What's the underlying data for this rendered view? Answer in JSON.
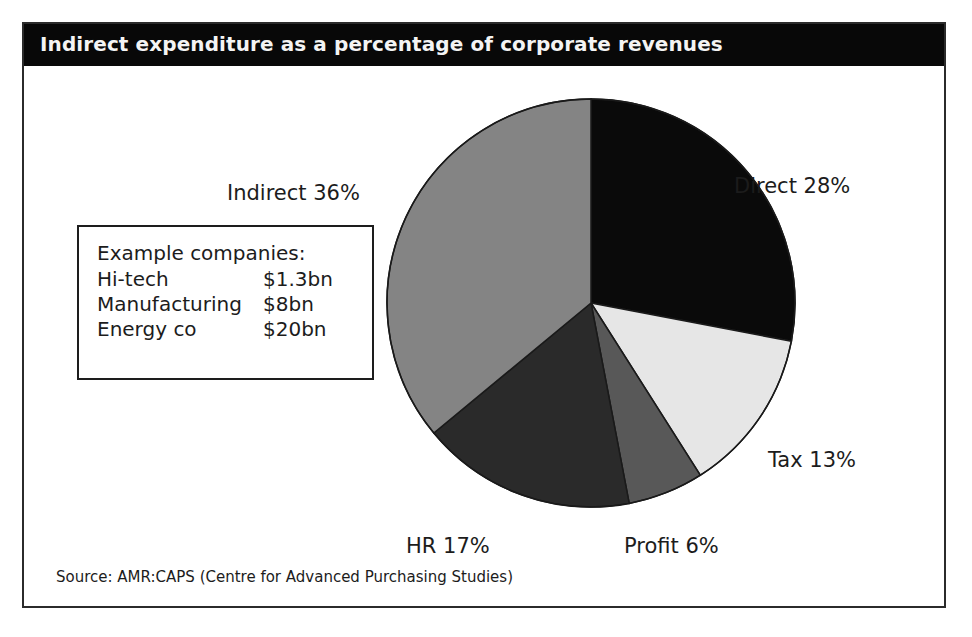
{
  "figure": {
    "title": "Indirect expenditure as a percentage of corporate revenues",
    "source": "Source: AMR:CAPS (Centre for Advanced Purchasing Studies)"
  },
  "example_box": {
    "heading": "Example companies:",
    "rows": [
      {
        "name": "Hi-tech",
        "value": "$1.3bn"
      },
      {
        "name": "Manufacturing",
        "value": "$8bn"
      },
      {
        "name": "Energy co",
        "value": "$20bn"
      }
    ]
  },
  "labels": {
    "indirect": "Indirect 36%",
    "direct": "Direct 28%",
    "tax": "Tax 13%",
    "hr": "HR 17%",
    "profit": "Profit 6%"
  },
  "colors": {
    "direct": "#0a0a0a",
    "tax": "#e6e6e6",
    "profit": "#585858",
    "hr": "#2a2a2a",
    "indirect": "#848484",
    "frame": "#2b2b2b",
    "banner": "#080808",
    "banner_text": "#f4f4f4"
  },
  "chart_data": {
    "type": "pie",
    "title": "Indirect expenditure as a percentage of corporate revenues",
    "xlabel": "",
    "ylabel": "",
    "units": "percent of corporate revenues",
    "start_angle_deg": 0,
    "direction": "clockwise",
    "legend": "none (direct slice labels)",
    "labels": [
      "Direct",
      "Tax",
      "Profit",
      "HR",
      "Indirect"
    ],
    "values": [
      28,
      13,
      6,
      17,
      36
    ],
    "total": 100,
    "slices": [
      {
        "label": "Direct",
        "value": 28,
        "display": "Direct 28%",
        "color": "#0a0a0a"
      },
      {
        "label": "Tax",
        "value": 13,
        "display": "Tax 13%",
        "color": "#e6e6e6"
      },
      {
        "label": "Profit",
        "value": 6,
        "display": "Profit 6%",
        "color": "#585858"
      },
      {
        "label": "HR",
        "value": 17,
        "display": "HR 17%",
        "color": "#2a2a2a"
      },
      {
        "label": "Indirect",
        "value": 36,
        "display": "Indirect 36%",
        "color": "#848484"
      }
    ],
    "annotations": [
      "Example companies: Hi-tech $1.3bn",
      "Example companies: Manufacturing $8bn",
      "Example companies: Energy co $20bn"
    ],
    "source": "Source: AMR:CAPS (Centre for Advanced Purchasing Studies)"
  }
}
